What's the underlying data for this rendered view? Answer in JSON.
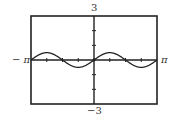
{
  "chart_data": {
    "type": "line",
    "title": "",
    "function": "y = 0.5 sin(2x)",
    "xlabel": "",
    "ylabel": "",
    "xlim": [
      -3.14159,
      3.14159
    ],
    "ylim": [
      -3,
      3
    ],
    "x_tick_labels": {
      "left": "−π",
      "right": "π"
    },
    "y_tick_labels": {
      "top": "3",
      "bottom": "−3"
    },
    "x_tick_step": 0.7854,
    "y_tick_step": 1,
    "grid": false,
    "legend": null,
    "series": [
      {
        "name": "curve",
        "x": [
          -3.1416,
          -2.3562,
          -1.5708,
          -0.7854,
          0,
          0.7854,
          1.5708,
          2.3562,
          3.1416
        ],
        "values": [
          0,
          0.5,
          0,
          -0.5,
          0,
          0.5,
          0,
          -0.5,
          0
        ]
      }
    ],
    "colors": {
      "frame": "#222222",
      "curve": "#222222",
      "axis": "#222222"
    }
  },
  "labels": {
    "y_max": "3",
    "y_min": "−3",
    "x_min": "− π",
    "x_max": "π"
  }
}
